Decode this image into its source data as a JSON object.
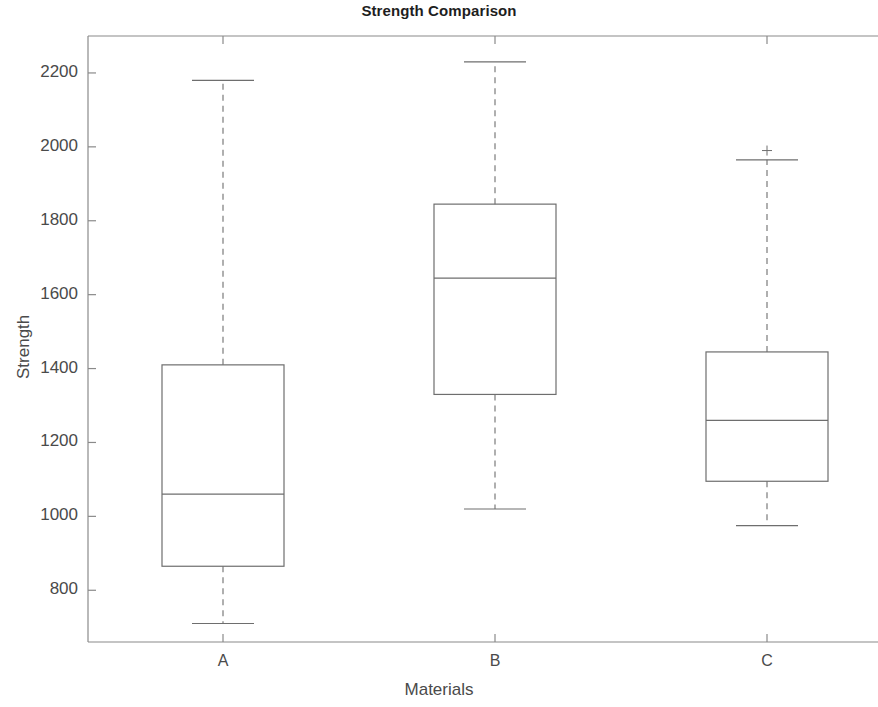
{
  "chart_data": {
    "type": "box",
    "title": "Strength Comparison",
    "xlabel": "Materials",
    "ylabel": "Strength",
    "categories": [
      "A",
      "B",
      "C"
    ],
    "ylim": [
      660,
      2300
    ],
    "yticks": [
      800,
      1000,
      1200,
      1400,
      1600,
      1800,
      2000,
      2200
    ],
    "ytick_labels": [
      "800",
      "1000",
      "1200",
      "1400",
      "1600",
      "1800",
      "2000",
      "2200"
    ],
    "grid": false,
    "legend": null,
    "box_color": "#6e6e6e",
    "whisker_style": "dashed",
    "boxes": [
      {
        "category": "A",
        "whisker_low": 710,
        "q1": 865,
        "median": 1060,
        "q3": 1410,
        "whisker_high": 2180,
        "outliers": []
      },
      {
        "category": "B",
        "whisker_low": 1020,
        "q1": 1330,
        "median": 1645,
        "q3": 1845,
        "whisker_high": 2230,
        "outliers": []
      },
      {
        "category": "C",
        "whisker_low": 975,
        "q1": 1095,
        "median": 1260,
        "q3": 1445,
        "whisker_high": 1965,
        "outliers": [
          1990
        ]
      }
    ]
  },
  "axes": {
    "title": "Strength Comparison",
    "x_axis_label": "Materials",
    "y_axis_label": "Strength",
    "y_tick_labels": [
      "2200",
      "2000",
      "1800",
      "1600",
      "1400",
      "1200",
      "1000",
      "800"
    ],
    "x_tick_labels": [
      "A",
      "B",
      "C"
    ]
  }
}
